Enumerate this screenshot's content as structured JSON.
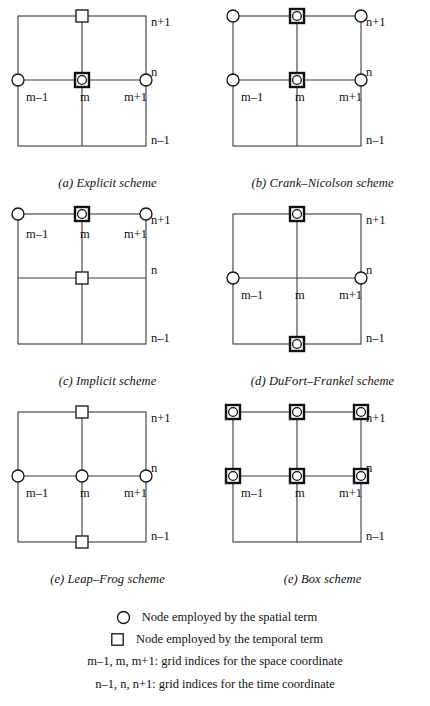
{
  "figure": {
    "axis_labels": {
      "space": [
        "m-1",
        "m",
        "m+1"
      ],
      "time": [
        "n-1",
        "n",
        "n+1"
      ]
    },
    "marker_legend": {
      "circle": "spatial-term-node",
      "square": "temporal-term-node",
      "circle_in_square": "spatial-and-temporal-term-node"
    },
    "panels": [
      {
        "id": "a",
        "caption": "(a) Explicit scheme",
        "label_row": "middle",
        "nodes": [
          {
            "col": "m",
            "row": "n+1",
            "marker": "square"
          },
          {
            "col": "m-1",
            "row": "n",
            "marker": "circle"
          },
          {
            "col": "m",
            "row": "n",
            "marker": "circle-in-square-bold"
          },
          {
            "col": "m+1",
            "row": "n",
            "marker": "circle"
          }
        ]
      },
      {
        "id": "b",
        "caption": "(b) Crank–Nicolson scheme",
        "label_row": "middle",
        "nodes": [
          {
            "col": "m-1",
            "row": "n+1",
            "marker": "circle"
          },
          {
            "col": "m",
            "row": "n+1",
            "marker": "circle-in-square-bold"
          },
          {
            "col": "m+1",
            "row": "n+1",
            "marker": "circle"
          },
          {
            "col": "m-1",
            "row": "n",
            "marker": "circle"
          },
          {
            "col": "m",
            "row": "n",
            "marker": "circle-in-square-bold"
          },
          {
            "col": "m+1",
            "row": "n",
            "marker": "circle"
          }
        ]
      },
      {
        "id": "c",
        "caption": "(c) Implicit scheme",
        "label_row": "top",
        "nodes": [
          {
            "col": "m-1",
            "row": "n+1",
            "marker": "circle"
          },
          {
            "col": "m",
            "row": "n+1",
            "marker": "circle-in-square-bold"
          },
          {
            "col": "m+1",
            "row": "n+1",
            "marker": "circle"
          },
          {
            "col": "m",
            "row": "n",
            "marker": "square"
          }
        ]
      },
      {
        "id": "d",
        "caption": "(d) DuFort–Frankel scheme",
        "label_row": "middle",
        "nodes": [
          {
            "col": "m",
            "row": "n+1",
            "marker": "circle-in-square-bold"
          },
          {
            "col": "m-1",
            "row": "n",
            "marker": "circle"
          },
          {
            "col": "m+1",
            "row": "n",
            "marker": "circle"
          },
          {
            "col": "m",
            "row": "n-1",
            "marker": "circle-in-square-bold"
          }
        ]
      },
      {
        "id": "e",
        "caption": "(e) Leap–Frog scheme",
        "label_row": "middle",
        "nodes": [
          {
            "col": "m",
            "row": "n+1",
            "marker": "square"
          },
          {
            "col": "m-1",
            "row": "n",
            "marker": "circle"
          },
          {
            "col": "m",
            "row": "n",
            "marker": "circle"
          },
          {
            "col": "m+1",
            "row": "n",
            "marker": "circle"
          },
          {
            "col": "m",
            "row": "n-1",
            "marker": "square"
          }
        ]
      },
      {
        "id": "f",
        "caption": "(e) Box scheme",
        "label_row": "middle",
        "nodes": [
          {
            "col": "m-1",
            "row": "n+1",
            "marker": "circle-in-square-bold"
          },
          {
            "col": "m",
            "row": "n+1",
            "marker": "circle-in-square-bold"
          },
          {
            "col": "m+1",
            "row": "n+1",
            "marker": "circle-in-square-bold"
          },
          {
            "col": "m-1",
            "row": "n",
            "marker": "circle-in-square-bold"
          },
          {
            "col": "m",
            "row": "n",
            "marker": "circle-in-square-bold"
          },
          {
            "col": "m+1",
            "row": "n",
            "marker": "circle-in-square-bold"
          }
        ]
      }
    ]
  },
  "legend": {
    "circle_text": "Node employed by the spatial term",
    "square_text": "Node employed by the temporal term",
    "space_index_text": "m–1, m, m+1:  grid indices for the space coordinate",
    "time_index_text": "n–1, n, n+1:  grid indices for the time coordinate"
  },
  "colors": {
    "ink": "#111111",
    "line": "#3a3a3a",
    "background": "#ffffff"
  }
}
